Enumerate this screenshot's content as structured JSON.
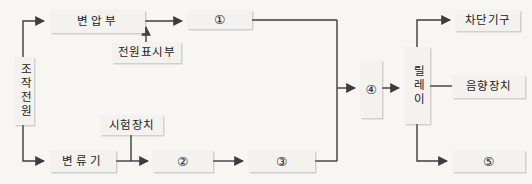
{
  "diagram": {
    "background_color": "#f7f6f3",
    "line_color": "#3c3c3c",
    "box_fill": "#f3f2ef",
    "box_border": "#4a4a4a",
    "nodes": [
      {
        "id": "control-power",
        "label": "조작전원",
        "orientation": "vertical"
      },
      {
        "id": "transformer",
        "label": "변압부",
        "orientation": "horizontal"
      },
      {
        "id": "power-indicator",
        "label": "전원표시부",
        "orientation": "horizontal"
      },
      {
        "id": "block-1",
        "label": "①",
        "orientation": "horizontal"
      },
      {
        "id": "current-transformer",
        "label": "변류기",
        "orientation": "horizontal"
      },
      {
        "id": "test-device",
        "label": "시험장치",
        "orientation": "horizontal"
      },
      {
        "id": "block-2",
        "label": "②",
        "orientation": "horizontal"
      },
      {
        "id": "block-3",
        "label": "③",
        "orientation": "horizontal"
      },
      {
        "id": "block-4",
        "label": "④",
        "orientation": "horizontal"
      },
      {
        "id": "relay",
        "label": "릴레이",
        "orientation": "vertical"
      },
      {
        "id": "breaker",
        "label": "차단기구",
        "orientation": "horizontal"
      },
      {
        "id": "sound-device",
        "label": "음향장치",
        "orientation": "horizontal"
      },
      {
        "id": "block-5",
        "label": "⑤",
        "orientation": "horizontal"
      }
    ],
    "connections": [
      {
        "from": "control-power",
        "to": "transformer",
        "arrow": true
      },
      {
        "from": "transformer",
        "to": "block-1",
        "arrow": true
      },
      {
        "from": "power-indicator",
        "to": "transformer-output",
        "arrow": true
      },
      {
        "from": "block-1",
        "to": "bus",
        "arrow": false
      },
      {
        "from": "control-power",
        "to": "current-transformer",
        "arrow": true
      },
      {
        "from": "current-transformer",
        "to": "block-2",
        "arrow": true
      },
      {
        "from": "test-device",
        "to": "ct-output",
        "arrow": false
      },
      {
        "from": "block-2",
        "to": "block-3",
        "arrow": true
      },
      {
        "from": "block-3",
        "to": "bus",
        "arrow": false
      },
      {
        "from": "bus",
        "to": "block-4",
        "arrow": true
      },
      {
        "from": "block-4",
        "to": "relay",
        "arrow": true
      },
      {
        "from": "relay",
        "to": "breaker",
        "arrow": true
      },
      {
        "from": "relay",
        "to": "sound-device",
        "arrow": false
      },
      {
        "from": "relay",
        "to": "block-5",
        "arrow": true
      }
    ]
  }
}
